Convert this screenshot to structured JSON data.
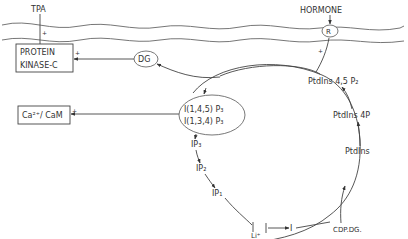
{
  "diagram": {
    "type": "phosphoinositide-cycle",
    "membrane": {
      "top_labels": {
        "tpa": "TPA",
        "hormone": "HORMONE",
        "receptor": "R"
      },
      "tpa_sign": "+",
      "hormone_sign": "+"
    },
    "boxes": {
      "protein_kinase_c": {
        "line1": "PROTEIN",
        "line2": "KINASE-C",
        "sign": "+"
      },
      "calcium": {
        "label": "Ca²⁺/ CaM",
        "sign": "+"
      }
    },
    "ellipses": {
      "dg": "DG",
      "ip3_isomers": {
        "line1": "I(1,4,5) P₃",
        "line2": "I(1,3,4) P₃"
      }
    },
    "cycle_nodes": {
      "ptdins_45p2": "PtdIns 4,5 P₂",
      "ptdins_4p": "PtdIns 4P",
      "ptdins": "PtdIns",
      "ip3": "IP₃",
      "ip2": "IP₂",
      "ip1": "IP₁",
      "inositol": "I",
      "lithium": "Li⁺",
      "cdp_dg": "CDP.DG."
    },
    "colors": {
      "line": "#444444",
      "text": "#333333",
      "membrane": "#666666"
    }
  }
}
